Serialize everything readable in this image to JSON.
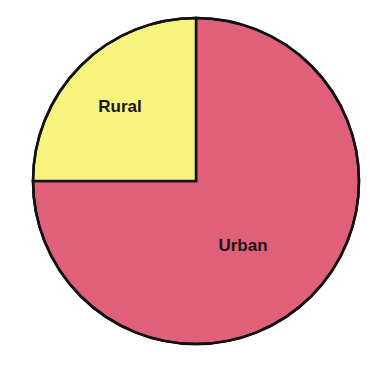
{
  "chart_data": {
    "type": "pie",
    "title": "",
    "categories": [
      "Rural",
      "Urban"
    ],
    "values": [
      25,
      75
    ],
    "units": "percent",
    "start_angle_deg": 90,
    "direction": "counterclockwise",
    "slices": [
      {
        "label": "Rural",
        "value": 25,
        "color": "#F7F47E"
      },
      {
        "label": "Urban",
        "value": 75,
        "color": "#E0607A"
      }
    ],
    "legend": "none (labels inside slices)",
    "outline_color": "#111111"
  },
  "labels": {
    "rural": "Rural",
    "urban": "Urban"
  }
}
